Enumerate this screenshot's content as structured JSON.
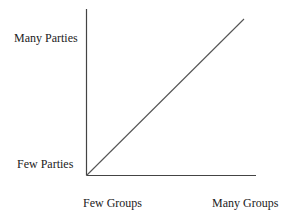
{
  "diagram": {
    "y_axis": {
      "top_label": "Many Parties",
      "bottom_label": "Few Parties"
    },
    "x_axis": {
      "left_label": "Few Groups",
      "right_label": "Many Groups"
    },
    "relationship": "positive linear",
    "line_color": "#555555",
    "axis_color": "#444444"
  }
}
